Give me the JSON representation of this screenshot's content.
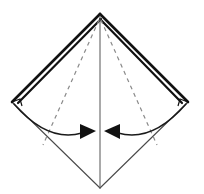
{
  "diagram": {
    "type": "origami-fold-instruction",
    "background_color": "#ffffff",
    "canvas": {
      "width": 204,
      "height": 194
    },
    "colors": {
      "solid_edge": "#111111",
      "thin_edge": "#4a4a4a",
      "dashed_crease": "#8a8a8a",
      "arrow": "#111111",
      "arc": "#1a1a1a",
      "fill": "#ffffff"
    },
    "vertices": {
      "apex": {
        "x": 100,
        "y": 14,
        "label": "top-apex"
      },
      "left": {
        "x": 12,
        "y": 102,
        "label": "left-corner"
      },
      "right": {
        "x": 188,
        "y": 102,
        "label": "right-corner"
      },
      "bottom": {
        "x": 100,
        "y": 188,
        "label": "bottom-corner"
      }
    },
    "shape": {
      "name": "kite-diamond-outline",
      "points": "100,14 12,102 100,188 188,102"
    },
    "layered_edges": {
      "name": "stacked-paper-layers",
      "description": "Doubled thick strokes along the two upper edges indicating multiple paper layers",
      "left_upper_outer": "100,14 12,102",
      "left_upper_inner": "101,19 18,103",
      "right_upper_outer": "100,14 188,102",
      "right_upper_inner": "100,19 182,103",
      "stroke_width_outer": 2.6,
      "stroke_width_inner": 2.2
    },
    "center_line": {
      "name": "vertical-center-crease",
      "from": {
        "x": 100,
        "y": 16
      },
      "to": {
        "x": 100,
        "y": 188
      },
      "style": "solid-thin"
    },
    "creases": [
      {
        "name": "left-valley-crease",
        "style": "dashed",
        "from": {
          "x": 99,
          "y": 20
        },
        "to": {
          "x": 43,
          "y": 145
        }
      },
      {
        "name": "right-valley-crease",
        "style": "dashed",
        "from": {
          "x": 101,
          "y": 20
        },
        "to": {
          "x": 157,
          "y": 145
        }
      }
    ],
    "fold_arrows": [
      {
        "name": "left-fold-arrow",
        "direction": "right",
        "arc_from": {
          "x": 14,
          "y": 104
        },
        "arc_control": {
          "x": 48,
          "y": 143
        },
        "arc_to": {
          "x": 82,
          "y": 133
        },
        "head_tip": {
          "x": 96,
          "y": 131
        },
        "head_points": "96,131 80,124 80,139"
      },
      {
        "name": "right-fold-arrow",
        "direction": "left",
        "arc_from": {
          "x": 186,
          "y": 104
        },
        "arc_control": {
          "x": 152,
          "y": 143
        },
        "arc_to": {
          "x": 118,
          "y": 133
        },
        "head_tip": {
          "x": 104,
          "y": 131
        },
        "head_points": "104,131 120,124 120,139"
      }
    ],
    "lower_edges": [
      {
        "name": "lower-left-edge",
        "from": {
          "x": 12,
          "y": 102
        },
        "to": {
          "x": 100,
          "y": 188
        }
      },
      {
        "name": "lower-right-edge",
        "from": {
          "x": 188,
          "y": 102
        },
        "to": {
          "x": 100,
          "y": 188
        }
      }
    ],
    "corner_notches": [
      {
        "name": "left-corner-notch",
        "points": "12,102 20,99 22,106"
      },
      {
        "name": "right-corner-notch",
        "points": "188,102 180,99 178,106"
      }
    ]
  }
}
